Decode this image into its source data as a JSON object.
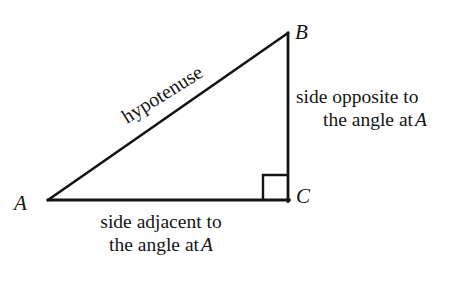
{
  "figure": {
    "background_color": "#ffffff",
    "stroke_color": "#141414"
  },
  "vertices": {
    "a": "A",
    "b": "B",
    "c": "C"
  },
  "labels": {
    "hypotenuse": "hypotenuse",
    "opposite": {
      "line1": "side opposite to",
      "line2_prefix": "the angle at",
      "line2_var": "A"
    },
    "adjacent": {
      "line1": "side adjacent to",
      "line2_prefix": "the angle at",
      "line2_var": "A"
    }
  },
  "geometry": {
    "point_a": {
      "x": 48,
      "y": 200
    },
    "point_b": {
      "x": 288,
      "y": 33
    },
    "point_c": {
      "x": 288,
      "y": 200
    },
    "right_angle_marker_size": 25,
    "line_width": 2.6,
    "hypotenuse_angle_deg": -32
  }
}
